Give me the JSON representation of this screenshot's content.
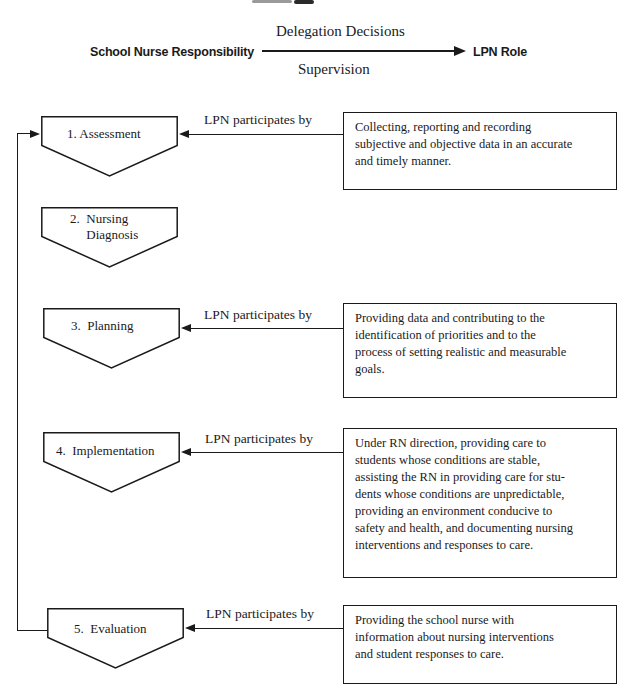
{
  "colors": {
    "ink": "#1a1a1a",
    "bg": "#ffffff"
  },
  "header": {
    "left_label": "School Nurse Responsibility",
    "arrow_top_label": "Delegation Decisions",
    "arrow_bottom_label": "Supervision",
    "right_label": "LPN Role"
  },
  "rows": [
    {
      "step": [
        "1. Assessment"
      ],
      "connector_label": "LPN participates by",
      "box": [
        "Collecting, reporting and recording",
        "subjective and objective data in an accurate",
        "and timely manner."
      ]
    },
    {
      "step": [
        "2.  Nursing",
        "     Diagnosis"
      ]
    },
    {
      "step": [
        "3.  Planning"
      ],
      "connector_label": "LPN participates by",
      "box": [
        "Providing data and contributing to the",
        "identification of priorities and to the",
        "process of setting realistic and measurable",
        "goals."
      ]
    },
    {
      "step": [
        "4.  Implementation"
      ],
      "connector_label": "LPN participates by",
      "box": [
        "Under RN direction, providing care to",
        "students whose conditions are stable,",
        "assisting the RN in providing care for stu-",
        "dents whose conditions are unpredictable,",
        "providing an environment conducive to",
        "safety and health, and documenting nursing",
        "interventions and responses to care."
      ]
    },
    {
      "step": [
        "5.  Evaluation"
      ],
      "connector_label": "LPN participates by",
      "box": [
        "Providing the school nurse with",
        "information about nursing interventions",
        "and student responses to care."
      ]
    }
  ]
}
